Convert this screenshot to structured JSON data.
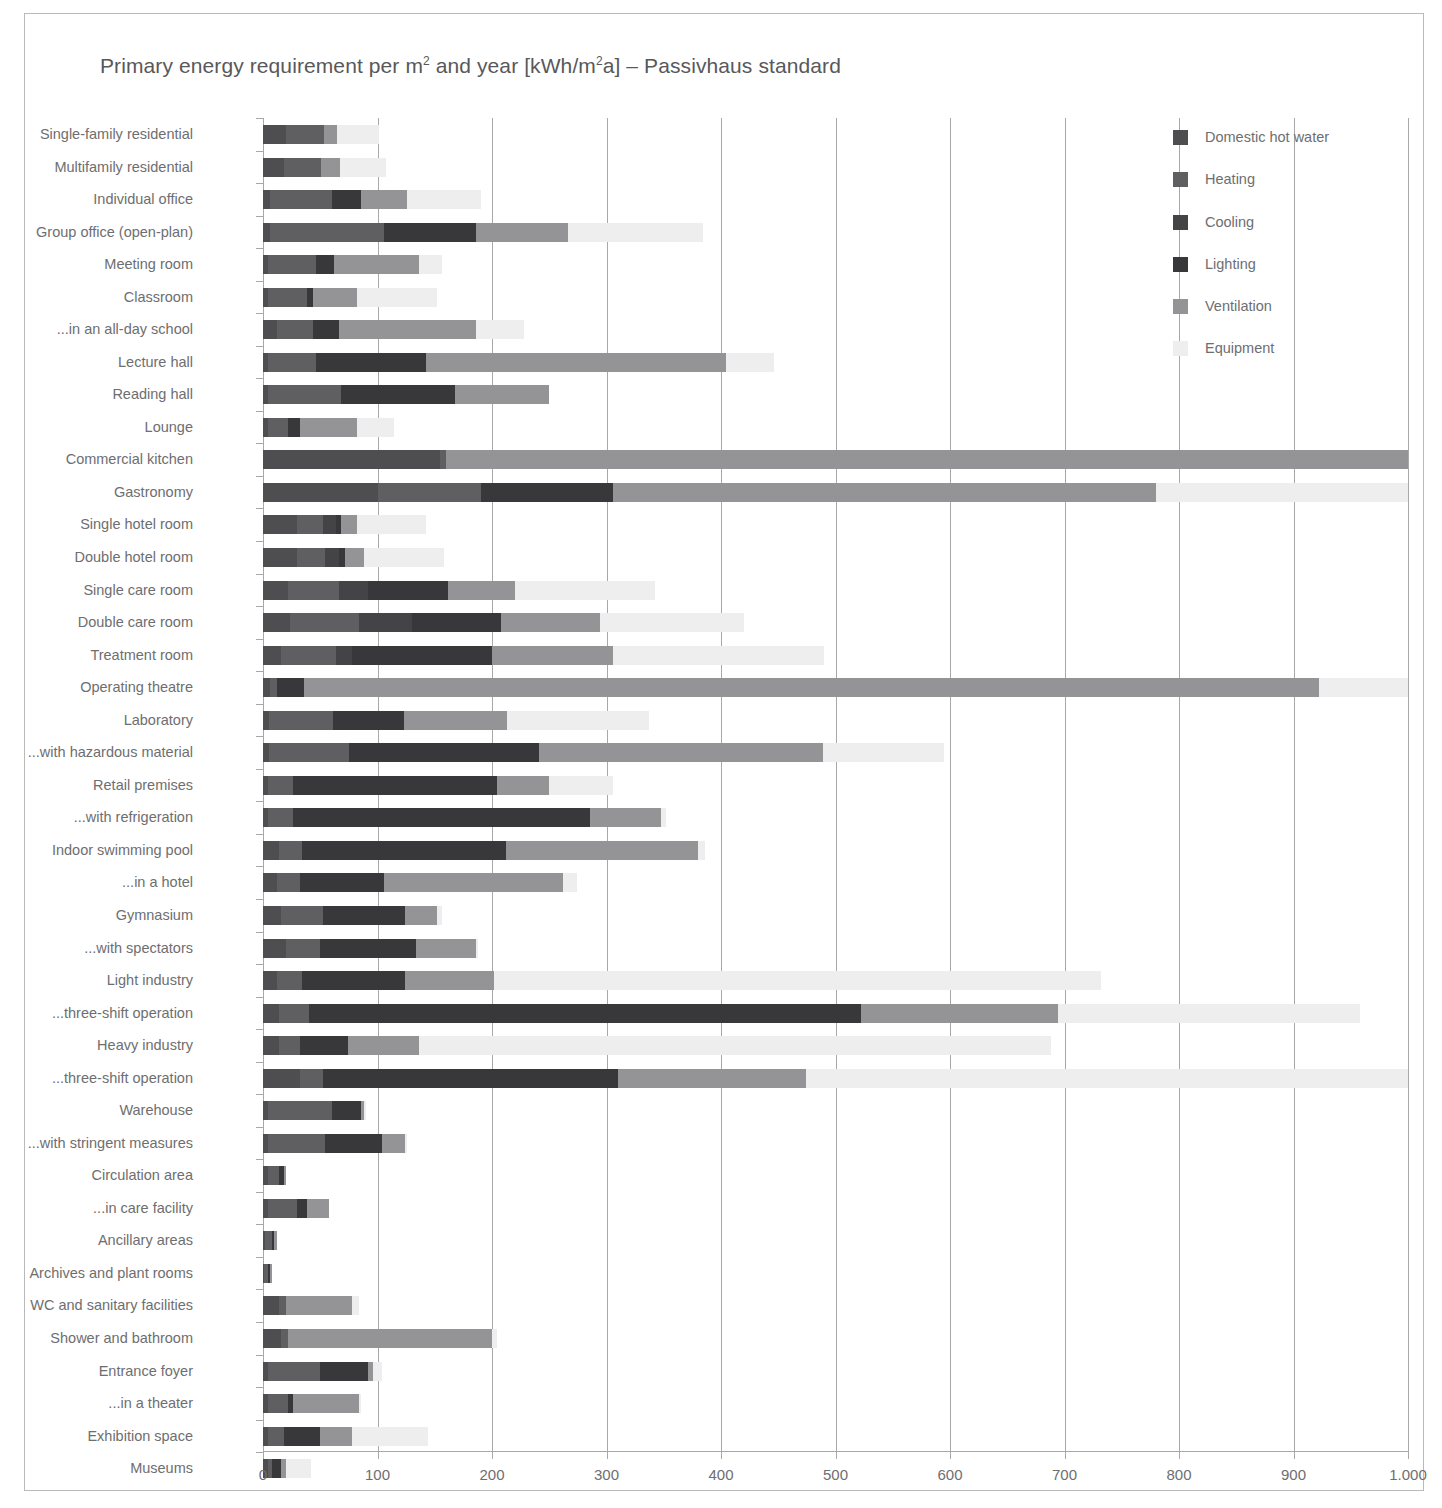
{
  "figure": {
    "title_prefix": "Primary energy requirement per m",
    "title_sup1": "2",
    "title_mid": " and year [kWh/m",
    "title_sup2": "2",
    "title_suffix": "a] – Passivhaus standard",
    "title_full": "Primary energy requirement per m2 and year [kWh/m2a] – Passivhaus standard",
    "border_color": "#b9b9b9",
    "grid_color": "#a8a8a8",
    "text_color": "#6e6e70"
  },
  "chart_data": {
    "type": "bar",
    "orientation": "horizontal",
    "stacked": true,
    "title": "Primary energy requirement per m2 and year [kWh/m2a] – Passivhaus standard",
    "xlabel": "",
    "ylabel": "",
    "xlim": [
      0,
      1000
    ],
    "xticks": [
      0,
      100,
      200,
      300,
      400,
      500,
      600,
      700,
      800,
      900,
      1000
    ],
    "xticklabels": [
      "0",
      "100",
      "200",
      "300",
      "400",
      "500",
      "600",
      "700",
      "800",
      "900",
      "1.000"
    ],
    "grid": "vertical",
    "legend_position": "top-right",
    "series_names": [
      "Domestic hot water",
      "Heating",
      "Cooling",
      "Lighting",
      "Ventilation",
      "Equipment"
    ],
    "series_colors": [
      "#4e4e50",
      "#5f5f61",
      "#444446",
      "#38383a",
      "#949496",
      "#eeeeee"
    ],
    "categories": [
      "Single-family residential",
      "Multifamily residential",
      "Individual office",
      "Group office (open-plan)",
      "Meeting room",
      "Classroom",
      "...in an all-day school",
      "Lecture hall",
      "Reading hall",
      "Lounge",
      "Commercial kitchen",
      "Gastronomy",
      "Single hotel room",
      "Double hotel room",
      "Single care room",
      "Double care room",
      "Treatment room",
      "Operating theatre",
      "Laboratory",
      "...with hazardous material",
      "Retail premises",
      "...with refrigeration",
      "Indoor swimming pool",
      "...in a hotel",
      "Gymnasium",
      "...with spectators",
      "Light industry",
      "...three-shift operation",
      "Heavy industry",
      "...three-shift operation",
      "Warehouse",
      "...with stringent measures",
      "Circulation area",
      "...in care facility",
      "Ancillary areas",
      "Archives and plant rooms",
      "WC and sanitary facilities",
      "Shower and bathroom",
      "Entrance foyer",
      "...in a theater",
      "Exhibition space",
      "Museums"
    ],
    "series": [
      {
        "name": "Domestic hot water",
        "values": [
          20,
          18,
          6,
          6,
          4,
          4,
          12,
          4,
          4,
          4,
          155,
          100,
          30,
          30,
          22,
          24,
          16,
          6,
          5,
          5,
          4,
          4,
          14,
          12,
          16,
          20,
          12,
          14,
          14,
          32,
          4,
          4,
          4,
          4,
          2,
          1,
          14,
          16,
          4,
          4,
          4,
          4
        ]
      },
      {
        "name": "Heating",
        "values": [
          33,
          33,
          54,
          100,
          42,
          34,
          32,
          42,
          64,
          18,
          5,
          90,
          22,
          24,
          44,
          60,
          48,
          6,
          56,
          70,
          22,
          22,
          20,
          20,
          36,
          30,
          22,
          26,
          18,
          20,
          56,
          50,
          10,
          26,
          6,
          3,
          6,
          6,
          46,
          18,
          14,
          4
        ]
      },
      {
        "name": "Cooling",
        "values": [
          0,
          0,
          0,
          0,
          0,
          0,
          0,
          0,
          0,
          0,
          0,
          0,
          12,
          12,
          26,
          46,
          14,
          0,
          0,
          0,
          0,
          0,
          0,
          0,
          0,
          0,
          0,
          0,
          0,
          0,
          0,
          0,
          0,
          0,
          0,
          0,
          0,
          0,
          0,
          0,
          0,
          0
        ]
      },
      {
        "name": "Lighting",
        "values": [
          0,
          0,
          26,
          80,
          16,
          6,
          22,
          96,
          100,
          10,
          0,
          116,
          4,
          6,
          70,
          78,
          122,
          24,
          62,
          166,
          178,
          260,
          178,
          74,
          72,
          84,
          90,
          482,
          42,
          258,
          26,
          50,
          4,
          8,
          2,
          2,
          0,
          0,
          42,
          4,
          32,
          8
        ]
      },
      {
        "name": "Ventilation",
        "values": [
          12,
          16,
          40,
          80,
          74,
          38,
          120,
          262,
          82,
          50,
          840,
          474,
          14,
          16,
          58,
          86,
          106,
          886,
          90,
          248,
          46,
          62,
          168,
          156,
          28,
          52,
          78,
          172,
          62,
          164,
          2,
          20,
          2,
          20,
          2,
          2,
          58,
          178,
          4,
          58,
          28,
          4
        ]
      },
      {
        "name": "Equipment",
        "values": [
          36,
          40,
          64,
          118,
          20,
          70,
          42,
          42,
          0,
          32,
          0,
          220,
          60,
          70,
          122,
          126,
          184,
          78,
          124,
          106,
          56,
          4,
          6,
          12,
          4,
          2,
          530,
          264,
          552,
          526,
          2,
          2,
          0,
          0,
          0,
          0,
          6,
          4,
          8,
          2,
          66,
          22
        ]
      }
    ],
    "totals": [
      101,
      107,
      190,
      384,
      178,
      152,
      228,
      446,
      250,
      114,
      1000,
      1000,
      142,
      158,
      342,
      420,
      490,
      1000,
      337,
      595,
      306,
      352,
      386,
      274,
      156,
      188,
      732,
      958,
      688,
      1000,
      90,
      126,
      20,
      58,
      12,
      8,
      84,
      204,
      104,
      86,
      144,
      42
    ]
  },
  "legend": {
    "items": [
      {
        "label": "Domestic hot water",
        "color": "#4e4e50"
      },
      {
        "label": "Heating",
        "color": "#5f5f61"
      },
      {
        "label": "Cooling",
        "color": "#444446"
      },
      {
        "label": "Lighting",
        "color": "#38383a"
      },
      {
        "label": "Ventilation",
        "color": "#949496"
      },
      {
        "label": "Equipment",
        "color": "#eeeeee"
      }
    ]
  }
}
